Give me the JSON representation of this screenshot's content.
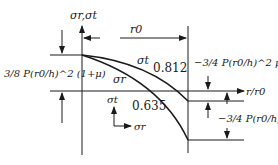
{
  "axes": {
    "y_label": "σr,σt",
    "x_label": "r/r0",
    "r0_label": "r0"
  },
  "curves": [
    {
      "name": "σt",
      "value_label": "0.812"
    },
    {
      "name": "σr",
      "value_label": "0.635"
    }
  ],
  "annotations": {
    "left_center": "3/8 P(r0/h)^2 (1+μ)",
    "right_top": "−3/4 P(r0/h)^2 μ",
    "right_bottom": "−3/4 P(r0/h)^2"
  },
  "legend": {
    "vertical": "σt",
    "horizontal": "σr"
  },
  "colors": {
    "line": "#1a1a1a",
    "background": "#ffffff"
  }
}
